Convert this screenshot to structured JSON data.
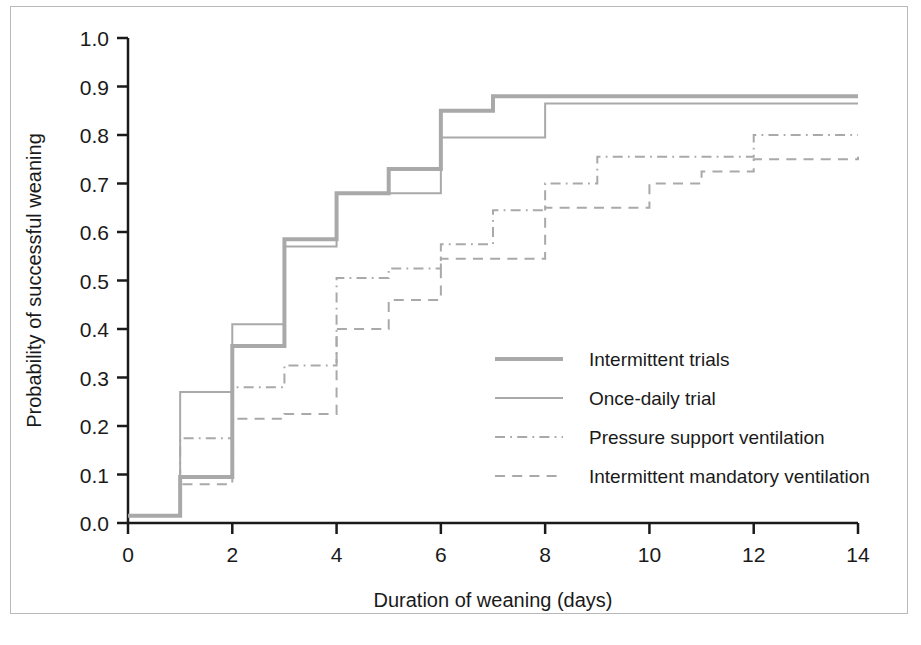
{
  "figure": {
    "background_color": "#ffffff",
    "frame_color": "#b9b9b9",
    "axis_color": "#1a1a1a",
    "series_color": "#a9a9a9"
  },
  "chart_data": {
    "type": "line",
    "subtype": "step",
    "title": "",
    "xlabel": "Duration of weaning (days)",
    "ylabel": "Probability of successful weaning",
    "xlim": [
      0,
      14
    ],
    "ylim": [
      0,
      1.0
    ],
    "xticks": [
      0,
      2,
      4,
      6,
      8,
      10,
      12,
      14
    ],
    "xtick_labels": [
      "0",
      "2",
      "4",
      "6",
      "8",
      "10",
      "12",
      "14"
    ],
    "yticks": [
      0.0,
      0.1,
      0.2,
      0.3,
      0.4,
      0.5,
      0.6,
      0.7,
      0.8,
      0.9,
      1.0
    ],
    "ytick_labels": [
      "0.0",
      "0.1",
      "0.2",
      "0.3",
      "0.4",
      "0.5",
      "0.6",
      "0.7",
      "0.8",
      "0.9",
      "1.0"
    ],
    "grid": false,
    "legend_position": "center-right",
    "x": [
      0,
      1,
      2,
      3,
      4,
      5,
      6,
      7,
      8,
      9,
      10,
      11,
      12,
      13,
      14
    ],
    "series": [
      {
        "name": "Intermittent trials",
        "style": "solid",
        "width": 4,
        "color": "#a9a9a9",
        "values": [
          0.015,
          0.095,
          0.365,
          0.585,
          0.68,
          0.73,
          0.85,
          0.88,
          0.88,
          0.88,
          0.88,
          0.88,
          0.88,
          0.88,
          0.88
        ]
      },
      {
        "name": "Once-daily trial",
        "style": "solid",
        "width": 2,
        "color": "#a9a9a9",
        "values": [
          0.015,
          0.27,
          0.41,
          0.57,
          0.68,
          0.68,
          0.795,
          0.795,
          0.865,
          0.865,
          0.865,
          0.865,
          0.865,
          0.865,
          0.865
        ]
      },
      {
        "name": "Pressure support ventilation",
        "style": "dashdot",
        "width": 2,
        "color": "#a9a9a9",
        "values": [
          0.015,
          0.175,
          0.28,
          0.325,
          0.505,
          0.525,
          0.575,
          0.645,
          0.7,
          0.755,
          0.755,
          0.755,
          0.8,
          0.8,
          0.8
        ]
      },
      {
        "name": "Intermittent mandatory ventilation",
        "style": "dashed",
        "width": 2,
        "color": "#a9a9a9",
        "values": [
          0.015,
          0.08,
          0.215,
          0.225,
          0.4,
          0.46,
          0.545,
          0.545,
          0.65,
          0.65,
          0.7,
          0.725,
          0.75,
          0.75,
          0.755
        ]
      }
    ],
    "legend": [
      {
        "label": "Intermittent trials",
        "style": "solid",
        "width": 4
      },
      {
        "label": "Once-daily trial",
        "style": "solid",
        "width": 2
      },
      {
        "label": "Pressure support ventilation",
        "style": "dashdot",
        "width": 2
      },
      {
        "label": "Intermittent mandatory ventilation",
        "style": "dashed",
        "width": 2
      }
    ]
  }
}
